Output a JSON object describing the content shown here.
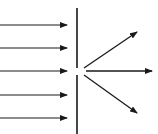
{
  "diagram": {
    "incident_rays": 5,
    "diffracted_rays": 3,
    "colors": {
      "stroke": "#1a1a1a",
      "background": "#ffffff"
    },
    "elements": {
      "barrier": "barrier-with-slit",
      "incident": "incident-ray-arrows",
      "diffracted": "diffracted-ray-arrows"
    }
  }
}
